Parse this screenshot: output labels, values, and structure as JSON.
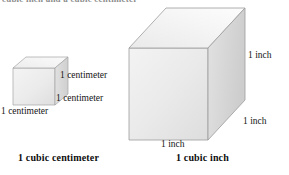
{
  "page": {
    "top_partial_text": "cubic inch and a cubic centimeter",
    "background_color": "#ffffff"
  },
  "figure": {
    "colors": {
      "front_face": "#e9e9e9",
      "top_face": "#f2f2f2",
      "right_face": "#dcdcdc",
      "edge": "#9a9a9a",
      "text": "#141414"
    },
    "small_cube": {
      "name": "1 cubic centimeter",
      "caption": "1 cubic centimeter",
      "edge_labels": {
        "height": "1 centimeter",
        "depth": "1 centimeter",
        "width": "1 centimeter"
      }
    },
    "large_cube": {
      "name": "1 cubic inch",
      "caption": "1 cubic inch",
      "edge_labels": {
        "height": "1 inch",
        "depth": "1 inch",
        "width": "1 inch"
      }
    }
  }
}
